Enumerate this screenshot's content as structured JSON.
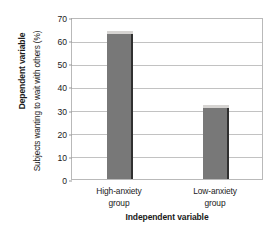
{
  "chart_data": {
    "type": "bar",
    "title": "",
    "categories": [
      "High-anxiety group",
      "Low-anxiety group"
    ],
    "category_lines": [
      [
        "High-anxiety",
        "group"
      ],
      [
        "Low-anxiety",
        "group"
      ]
    ],
    "values": [
      63,
      31
    ],
    "xlabel": "Independent variable",
    "ylabel": "Subjects wanting to wait with others (%)",
    "ylabel_outer": "Dependent variable",
    "ylim": [
      0,
      70
    ],
    "yticks": [
      0,
      10,
      20,
      30,
      40,
      50,
      60,
      70
    ],
    "ytick_labels": [
      "0",
      "10",
      "20",
      "30",
      "40",
      "50",
      "60",
      "70"
    ],
    "grid": true,
    "legend": false,
    "bar_color": "#787878",
    "bar_edge_color": "#303030",
    "bar_highlight_color": "#d6d4d2",
    "grid_color": "#c2c2c2",
    "frame_color": "#b9b9b9",
    "text_color": "#1a1a1a"
  }
}
